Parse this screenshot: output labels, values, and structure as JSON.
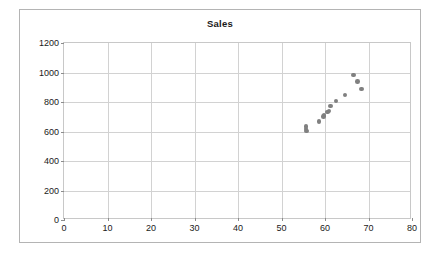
{
  "chart_data": {
    "type": "scatter",
    "title": "Sales",
    "xlabel": "",
    "ylabel": "",
    "xlim": [
      0,
      80
    ],
    "ylim": [
      0,
      1200
    ],
    "xticks": [
      0,
      10,
      20,
      30,
      40,
      50,
      60,
      70,
      80
    ],
    "yticks": [
      0,
      200,
      400,
      600,
      800,
      1000,
      1200
    ],
    "grid": true,
    "legend": false,
    "marker_color": "#808080",
    "series": [
      {
        "name": "Sales",
        "points": [
          {
            "x": 55.6,
            "y": 635
          },
          {
            "x": 55.6,
            "y": 618
          },
          {
            "x": 55.7,
            "y": 604
          },
          {
            "x": 58.6,
            "y": 667
          },
          {
            "x": 59.6,
            "y": 700
          },
          {
            "x": 59.8,
            "y": 711
          },
          {
            "x": 60.6,
            "y": 733
          },
          {
            "x": 60.9,
            "y": 739
          },
          {
            "x": 61.2,
            "y": 772
          },
          {
            "x": 62.5,
            "y": 807
          },
          {
            "x": 64.6,
            "y": 847
          },
          {
            "x": 66.5,
            "y": 984
          },
          {
            "x": 67.5,
            "y": 937
          },
          {
            "x": 68.4,
            "y": 888
          }
        ]
      }
    ]
  }
}
